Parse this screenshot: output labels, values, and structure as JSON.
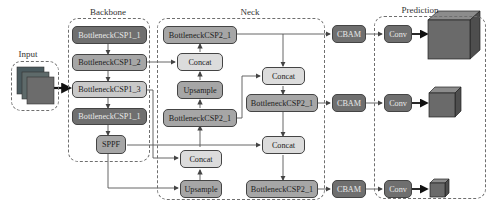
{
  "sections": {
    "input": "Input",
    "backbone": "Backbone",
    "neck": "Neck",
    "prediction": "Prediction"
  },
  "backbone": {
    "blocks": [
      "BottleneckCSP1_1",
      "BottleneckCSP1_2",
      "BottleneckCSP1_3",
      "BottleneckCSP1_1",
      "SPPF"
    ]
  },
  "neck": {
    "left_column": [
      "BottleneckCSP2_1",
      "Concat",
      "Upsample",
      "BottleneckCSP2_1",
      "Concat",
      "Upsample"
    ],
    "right_column": [
      "Concat",
      "BottleneckCSP2_1",
      "Concat",
      "BottleneckCSP2_1"
    ]
  },
  "attention": [
    "CBAM",
    "CBAM",
    "CBAM"
  ],
  "prediction": {
    "heads": [
      "Conv",
      "Conv",
      "Conv"
    ],
    "outputs": [
      "large-scale-feature-cube",
      "medium-scale-feature-cube",
      "small-scale-feature-cube"
    ]
  },
  "colors": {
    "dark_block": "#6f6f6f",
    "mid_block": "#a6a6a6",
    "light_block": "#c9c9c9",
    "pale_block": "#dcdcdc",
    "cube_front": "#6a6a6a",
    "line": "#555555"
  }
}
